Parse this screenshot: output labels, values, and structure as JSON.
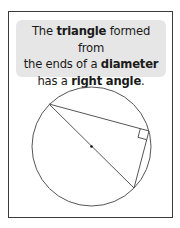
{
  "note": {
    "line1": {
      "t1": "The ",
      "b1": "triangle",
      "t2": " formed from"
    },
    "line2": {
      "t1": "the ends of a ",
      "b1": "diameter"
    },
    "line3": {
      "t1": "has a ",
      "b1": "right angle",
      "t2": "."
    }
  },
  "diagram": {
    "circle": {
      "cx": 91.5,
      "cy": 146.5,
      "r": 59.5
    },
    "vertices": {
      "diameter_start": [
        49,
        104
      ],
      "diameter_end": [
        134,
        188
      ],
      "right_angle": [
        149,
        131
      ]
    },
    "colors": {
      "line": "#555555",
      "box": "#e6e6e6",
      "frame": "#3a3a3a"
    }
  }
}
